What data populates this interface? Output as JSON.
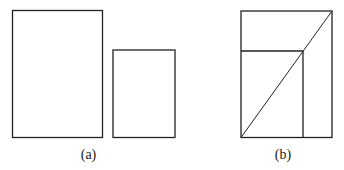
{
  "figures": [
    {
      "label": "(a)",
      "description": "Two separate rectangles: a large one and a smaller one",
      "rects": [
        {
          "x": 12.5,
          "y": 10.5,
          "w": 90,
          "h": 127
        },
        {
          "x": 113,
          "y": 50,
          "w": 62,
          "h": 87.5
        }
      ]
    },
    {
      "label": "(b)",
      "description": "Small rectangle nested in bottom-left corner of large rectangle, diagonal from bottom-left to top-right passing through the small rectangle's top-right corner",
      "outer": {
        "x": 241,
        "y": 11,
        "w": 91,
        "h": 126.5
      },
      "inner": {
        "x": 241,
        "y": 51,
        "w": 62,
        "h": 86.5
      },
      "diagonal": {
        "x1": 241,
        "y1": 137.5,
        "x2": 332,
        "y2": 11
      }
    }
  ],
  "colors": {
    "stroke": "#222222",
    "background": "#ffffff"
  }
}
